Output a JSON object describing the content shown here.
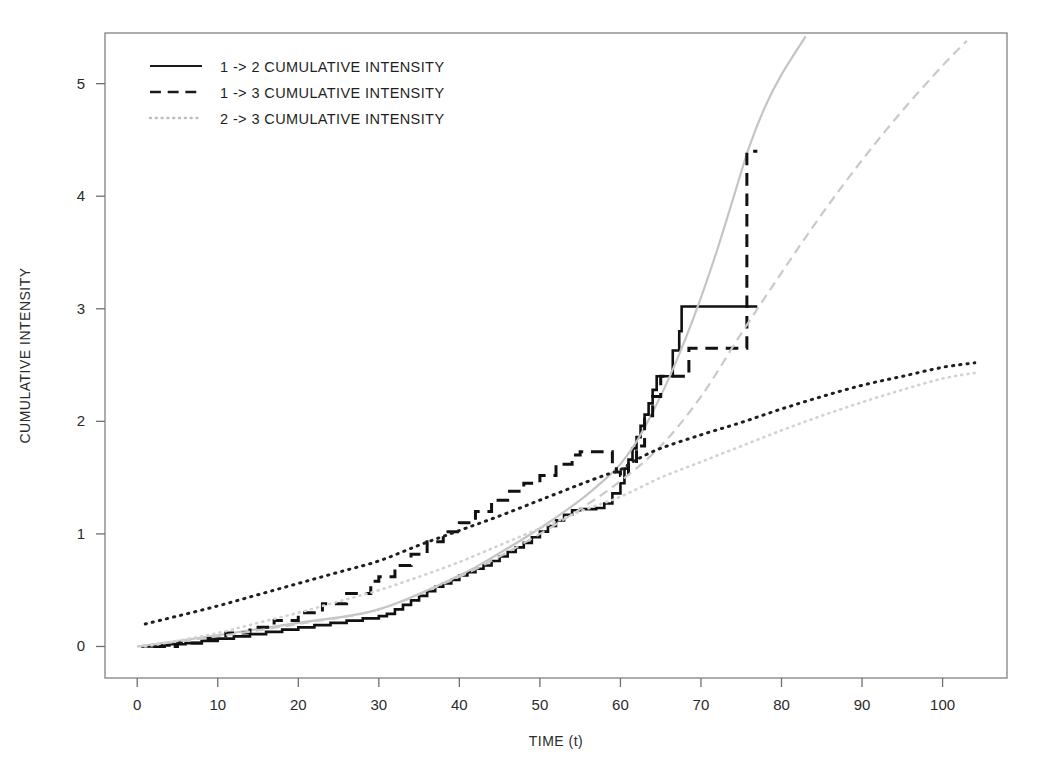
{
  "figure": {
    "background": "#ffffff",
    "plot_box": {
      "left": 105,
      "top": 33,
      "right": 1007,
      "bottom": 678
    }
  },
  "chart_data": {
    "type": "line",
    "title": "",
    "xlabel": "TIME (t)",
    "ylabel": "CUMULATIVE INTENSITY",
    "xlim": [
      -4,
      108
    ],
    "ylim": [
      -0.28,
      5.45
    ],
    "xticks": [
      0,
      10,
      20,
      30,
      40,
      50,
      60,
      70,
      80,
      90,
      100
    ],
    "xtick_labels": [
      "0",
      "10",
      "20",
      "30",
      "40",
      "50",
      "60",
      "70",
      "80",
      "90",
      "100"
    ],
    "yticks": [
      0,
      1,
      2,
      3,
      4,
      5
    ],
    "ytick_labels": [
      "0",
      "1",
      "2",
      "3",
      "4",
      "5"
    ],
    "grid": false,
    "legend_position": "top-left",
    "legend": [
      {
        "label": "1 -> 2  CUMULATIVE  INTENSITY",
        "dash": "solid",
        "color": "#1a1a1a"
      },
      {
        "label": "1 -> 3  CUMULATIVE  INTENSITY",
        "dash": "dashed",
        "color": "#1a1a1a"
      },
      {
        "label": "2 -> 3  CUMULATIVE  INTENSITY",
        "dash": "dotted",
        "color": "#bdbdbd"
      }
    ],
    "series": [
      {
        "name": "1 -> 2 empirical cumulative intensity",
        "style": "step",
        "dash": "solid",
        "color": "#111111",
        "width": 2.6,
        "points": [
          [
            0.5,
            0.0
          ],
          [
            2,
            0.01
          ],
          [
            4,
            0.02
          ],
          [
            6,
            0.03
          ],
          [
            8,
            0.05
          ],
          [
            10,
            0.07
          ],
          [
            12,
            0.09
          ],
          [
            14,
            0.11
          ],
          [
            16,
            0.13
          ],
          [
            18,
            0.15
          ],
          [
            20,
            0.17
          ],
          [
            22,
            0.19
          ],
          [
            24,
            0.21
          ],
          [
            26,
            0.23
          ],
          [
            28,
            0.25
          ],
          [
            30,
            0.27
          ],
          [
            31,
            0.29
          ],
          [
            32,
            0.33
          ],
          [
            33,
            0.37
          ],
          [
            34,
            0.41
          ],
          [
            35,
            0.45
          ],
          [
            36,
            0.49
          ],
          [
            37,
            0.53
          ],
          [
            38,
            0.56
          ],
          [
            39,
            0.59
          ],
          [
            40,
            0.63
          ],
          [
            41,
            0.66
          ],
          [
            42,
            0.69
          ],
          [
            43,
            0.72
          ],
          [
            44,
            0.76
          ],
          [
            45,
            0.8
          ],
          [
            46,
            0.84
          ],
          [
            47,
            0.88
          ],
          [
            48,
            0.92
          ],
          [
            49,
            0.97
          ],
          [
            50,
            1.02
          ],
          [
            51,
            1.07
          ],
          [
            52,
            1.12
          ],
          [
            53,
            1.17
          ],
          [
            54,
            1.21
          ],
          [
            55,
            1.22
          ],
          [
            56,
            1.22
          ],
          [
            57,
            1.23
          ],
          [
            58,
            1.27
          ],
          [
            59,
            1.36
          ],
          [
            60,
            1.45
          ],
          [
            60.5,
            1.58
          ],
          [
            61,
            1.66
          ],
          [
            61.5,
            1.76
          ],
          [
            62,
            1.86
          ],
          [
            62.5,
            1.96
          ],
          [
            63,
            2.06
          ],
          [
            63.5,
            2.16
          ],
          [
            64,
            2.28
          ],
          [
            64.5,
            2.4
          ],
          [
            65,
            2.4
          ],
          [
            66,
            2.4
          ],
          [
            66.5,
            2.63
          ],
          [
            67,
            2.63
          ],
          [
            67.3,
            2.8
          ],
          [
            67.6,
            3.02
          ],
          [
            68,
            3.02
          ],
          [
            72,
            3.02
          ],
          [
            77,
            3.02
          ]
        ]
      },
      {
        "name": "1 -> 2 fitted (model) cumulative intensity",
        "style": "smooth",
        "dash": "solid",
        "color": "#c4c4c4",
        "width": 2.2,
        "points": [
          [
            0,
            0.0
          ],
          [
            10,
            0.1
          ],
          [
            20,
            0.21
          ],
          [
            30,
            0.33
          ],
          [
            40,
            0.63
          ],
          [
            45,
            0.83
          ],
          [
            50,
            1.05
          ],
          [
            55,
            1.3
          ],
          [
            58,
            1.48
          ],
          [
            60,
            1.62
          ],
          [
            62,
            1.82
          ],
          [
            64,
            2.08
          ],
          [
            66,
            2.38
          ],
          [
            68,
            2.72
          ],
          [
            70,
            3.1
          ],
          [
            72,
            3.52
          ],
          [
            74,
            3.98
          ],
          [
            76,
            4.44
          ],
          [
            78,
            4.8
          ],
          [
            80,
            5.08
          ],
          [
            83,
            5.42
          ]
        ]
      },
      {
        "name": "1 -> 3 empirical cumulative intensity",
        "style": "step",
        "dash": "dashed",
        "color": "#111111",
        "width": 3.0,
        "points": [
          [
            2,
            0.0
          ],
          [
            5,
            0.03
          ],
          [
            8,
            0.07
          ],
          [
            11,
            0.12
          ],
          [
            14,
            0.17
          ],
          [
            17,
            0.23
          ],
          [
            20,
            0.3
          ],
          [
            23,
            0.38
          ],
          [
            26,
            0.47
          ],
          [
            29,
            0.58
          ],
          [
            30,
            0.62
          ],
          [
            32,
            0.72
          ],
          [
            34,
            0.82
          ],
          [
            36,
            0.93
          ],
          [
            38,
            1.02
          ],
          [
            40,
            1.1
          ],
          [
            42,
            1.2
          ],
          [
            44,
            1.3
          ],
          [
            46,
            1.38
          ],
          [
            48,
            1.45
          ],
          [
            50,
            1.52
          ],
          [
            52,
            1.62
          ],
          [
            54,
            1.7
          ],
          [
            55,
            1.73
          ],
          [
            57,
            1.73
          ],
          [
            58,
            1.73
          ],
          [
            59,
            1.6
          ],
          [
            59.5,
            1.55
          ],
          [
            60,
            1.52
          ],
          [
            61,
            1.62
          ],
          [
            62,
            1.78
          ],
          [
            63,
            2.05
          ],
          [
            64,
            2.22
          ],
          [
            65,
            2.4
          ],
          [
            66,
            2.4
          ],
          [
            68,
            2.4
          ],
          [
            68.5,
            2.65
          ],
          [
            70,
            2.65
          ],
          [
            74,
            2.65
          ],
          [
            75.5,
            2.65
          ],
          [
            75.7,
            4.4
          ],
          [
            77,
            4.4
          ]
        ]
      },
      {
        "name": "1 -> 3 fitted (model) cumulative intensity",
        "style": "smooth",
        "dash": "dashed",
        "color": "#c9c9c9",
        "width": 2.2,
        "points": [
          [
            0,
            0.0
          ],
          [
            10,
            0.09
          ],
          [
            20,
            0.2
          ],
          [
            30,
            0.33
          ],
          [
            40,
            0.62
          ],
          [
            45,
            0.8
          ],
          [
            50,
            1.0
          ],
          [
            55,
            1.22
          ],
          [
            60,
            1.47
          ],
          [
            65,
            1.78
          ],
          [
            70,
            2.22
          ],
          [
            75,
            2.78
          ],
          [
            80,
            3.32
          ],
          [
            85,
            3.84
          ],
          [
            90,
            4.32
          ],
          [
            95,
            4.76
          ],
          [
            100,
            5.16
          ],
          [
            103,
            5.38
          ]
        ]
      },
      {
        "name": "2 -> 3 empirical cumulative intensity",
        "style": "smooth",
        "dash": "dotted",
        "color": "#1f1f1f",
        "width": 3.0,
        "points": [
          [
            1,
            0.2
          ],
          [
            5,
            0.27
          ],
          [
            10,
            0.36
          ],
          [
            15,
            0.46
          ],
          [
            20,
            0.56
          ],
          [
            25,
            0.66
          ],
          [
            30,
            0.76
          ],
          [
            35,
            0.9
          ],
          [
            40,
            1.03
          ],
          [
            45,
            1.16
          ],
          [
            50,
            1.3
          ],
          [
            55,
            1.44
          ],
          [
            58,
            1.52
          ],
          [
            60,
            1.57
          ],
          [
            62,
            1.66
          ],
          [
            65,
            1.76
          ],
          [
            70,
            1.88
          ],
          [
            75,
            1.99
          ],
          [
            80,
            2.11
          ],
          [
            85,
            2.22
          ],
          [
            90,
            2.32
          ],
          [
            95,
            2.4
          ],
          [
            100,
            2.48
          ],
          [
            104,
            2.52
          ]
        ]
      },
      {
        "name": "2 -> 3 fitted (model) cumulative intensity",
        "style": "smooth",
        "dash": "dotted",
        "color": "#d2d2d2",
        "width": 2.6,
        "points": [
          [
            1,
            0.0
          ],
          [
            5,
            0.05
          ],
          [
            10,
            0.12
          ],
          [
            15,
            0.21
          ],
          [
            20,
            0.3
          ],
          [
            25,
            0.4
          ],
          [
            30,
            0.5
          ],
          [
            35,
            0.62
          ],
          [
            40,
            0.75
          ],
          [
            45,
            0.9
          ],
          [
            50,
            1.05
          ],
          [
            55,
            1.2
          ],
          [
            60,
            1.33
          ],
          [
            65,
            1.5
          ],
          [
            70,
            1.64
          ],
          [
            75,
            1.78
          ],
          [
            80,
            1.92
          ],
          [
            85,
            2.05
          ],
          [
            90,
            2.17
          ],
          [
            95,
            2.28
          ],
          [
            100,
            2.38
          ],
          [
            104,
            2.43
          ]
        ]
      }
    ]
  }
}
